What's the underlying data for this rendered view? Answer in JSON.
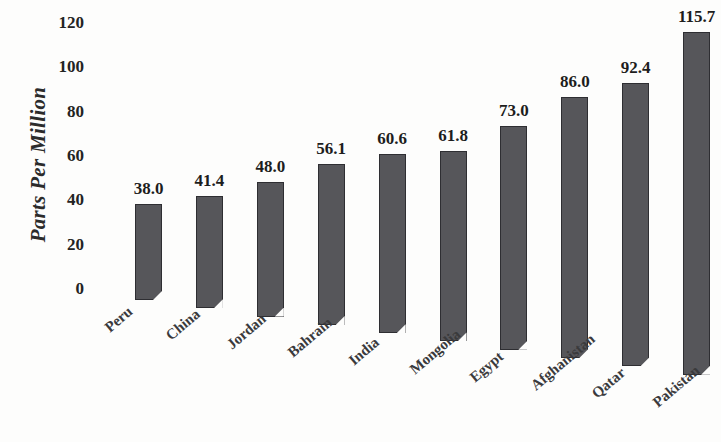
{
  "chart_data": {
    "type": "bar",
    "title": "",
    "subtitle": "",
    "xlabel": "",
    "ylabel": "Parts Per Million",
    "categories": [
      "Peru",
      "China",
      "Jordan",
      "Bahrain",
      "India",
      "Mongolia",
      "Egypt",
      "Afghanistan",
      "Qatar",
      "Pakistan"
    ],
    "values": [
      38.0,
      41.4,
      48.0,
      56.1,
      60.6,
      61.8,
      73.0,
      86.0,
      92.4,
      115.7
    ],
    "value_labels": [
      "38.0",
      "41.4",
      "48.0",
      "56.1",
      "60.6",
      "61.8",
      "73.0",
      "86.0",
      "92.4",
      "115.7"
    ],
    "ylim": [
      0,
      120
    ],
    "ytick_values": [
      0,
      20,
      40,
      60,
      80,
      100,
      120
    ],
    "ytick_labels": [
      "0",
      "20",
      "40",
      "60",
      "80",
      "100",
      "120"
    ],
    "grid": false,
    "legend": false,
    "legend_position": "none",
    "bar_color": "#56565a",
    "bar_edge_color": "#2e2e32",
    "background_color": "#fdfdfc",
    "text_color": "#232323",
    "category_label_rotation_degrees": -40,
    "data_labels_shown": true
  },
  "axis": {
    "y_title": "Parts Per Million"
  }
}
